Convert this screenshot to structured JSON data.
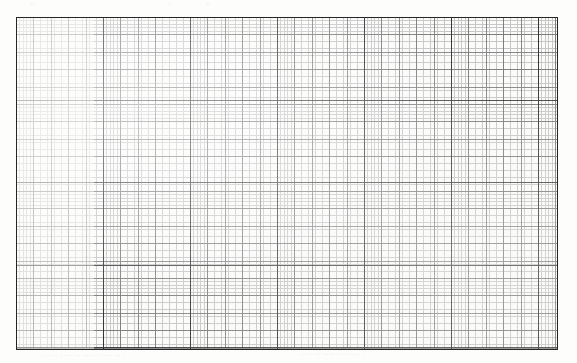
{
  "document": {
    "type": "graph-paper-scan",
    "description": "Scanned sheet of fine-ruled engineering graph paper",
    "background_color": "#fdfdfc",
    "paper_color": "#fbfbfa"
  },
  "grid": {
    "bounds": {
      "left": 16,
      "top": 17,
      "width": 542,
      "height": 333,
      "right": 558,
      "bottom": 350
    },
    "border_color": "#262626",
    "border_width": 1.4,
    "tiers": [
      {
        "name": "fine",
        "label": "fine grid",
        "pitch_px": 3.48,
        "line_color": "#b9b9b9",
        "line_width": 0.6
      },
      {
        "name": "medium",
        "label": "medium grid",
        "pitch_px": 17.4,
        "line_color": "#6e6e6e",
        "line_width": 0.9
      },
      {
        "name": "major",
        "label": "major grid",
        "pitch_x_px": 87,
        "pitch_y_px": 82.5,
        "line_color": "#2b2b2b",
        "line_width": 1.3
      }
    ],
    "major_verticals_px": [
      16,
      94,
      181,
      268,
      355,
      442,
      529,
      558
    ],
    "major_horizontals_px": [
      17,
      103,
      186,
      268,
      350
    ],
    "faded_block": {
      "label": "faded left block",
      "left": 16,
      "top": 17,
      "width": 78,
      "height": 333,
      "opacity": 0.46
    }
  },
  "artifacts": {
    "bleed_through": [
      {
        "id": "top-a",
        "text": "··"
      },
      {
        "id": "top-b",
        "text": "-"
      },
      {
        "id": "top-c",
        "text": "~"
      },
      {
        "id": "bottom-a",
        "text": "·   ·  ·· · ···   ·· ···· ·   ···· ·· ·"
      },
      {
        "id": "bottom-b",
        "text": "··· · ··  ···· ·  ···  ··· ·"
      }
    ]
  }
}
